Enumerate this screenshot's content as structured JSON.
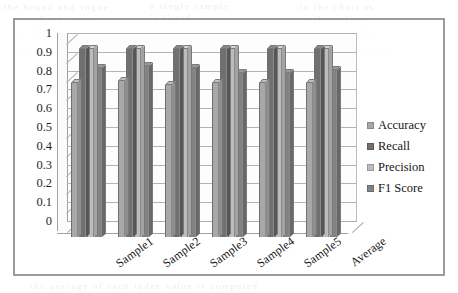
{
  "chart_data": {
    "type": "bar",
    "title": "",
    "subtitle": "",
    "xlabel": "",
    "ylabel": "",
    "ylim": [
      0,
      1
    ],
    "grid": true,
    "legend_position": "right",
    "style": "3d-clustered-column-grayscale",
    "categories": [
      "Sample1",
      "Sample2",
      "Sample3",
      "Sample4",
      "Sample5",
      "Average"
    ],
    "y_ticks": [
      "1",
      "0.9",
      "0.8",
      "0.7",
      "0.6",
      "0.5",
      "0.4",
      "0.3",
      "0.2",
      "0.1",
      "0"
    ],
    "y_tick_values": [
      1,
      0.9,
      0.8,
      0.7,
      0.6,
      0.5,
      0.4,
      0.3,
      0.2,
      0.1,
      0
    ],
    "series": [
      {
        "name": "Accuracy",
        "color": "#a8a8a8",
        "values": [
          0.82,
          0.83,
          0.81,
          0.82,
          0.82,
          0.82
        ]
      },
      {
        "name": "Recall",
        "color": "#707070",
        "values": [
          1.0,
          1.0,
          1.0,
          1.0,
          1.0,
          1.0
        ]
      },
      {
        "name": "Precision",
        "color": "#bdbdbd",
        "values": [
          1.0,
          1.0,
          1.0,
          1.0,
          1.0,
          1.0
        ]
      },
      {
        "name": "F1 Score",
        "color": "#828282",
        "values": [
          0.9,
          0.91,
          0.9,
          0.87,
          0.87,
          0.89
        ]
      }
    ]
  },
  "legend": {
    "items": [
      {
        "label": "Accuracy",
        "swatch": "#a8a8a8"
      },
      {
        "label": "Recall",
        "swatch": "#707070"
      },
      {
        "label": "Precision",
        "swatch": "#bdbdbd"
      },
      {
        "label": "F1 Score",
        "swatch": "#828282"
      }
    ]
  },
  "scan_artifacts": {
    "lines": [
      {
        "text": "the bound and vague",
        "left": 4,
        "top": 2,
        "size": 9
      },
      {
        "text": "a single sample",
        "left": 150,
        "top": 1,
        "size": 9
      },
      {
        "text": "in the chart as",
        "left": 300,
        "top": 2,
        "size": 9
      },
      {
        "text": "result  of  image",
        "left": 18,
        "top": 14,
        "size": 9
      },
      {
        "text": "is  listed",
        "left": 150,
        "top": 13,
        "size": 9
      },
      {
        "text": "in  the  values",
        "left": 300,
        "top": 14,
        "size": 9
      },
      {
        "text": "of  the",
        "left": 18,
        "top": 27,
        "size": 9
      },
      {
        "text": "so that",
        "left": 340,
        "top": 27,
        "size": 9
      },
      {
        "text": "precision",
        "left": 14,
        "top": 48,
        "size": 9
      },
      {
        "text": "and recall",
        "left": 340,
        "top": 48,
        "size": 9
      },
      {
        "text": "the  average  of  each  index  value  is  computed",
        "left": 30,
        "top": 281,
        "size": 9
      }
    ]
  }
}
